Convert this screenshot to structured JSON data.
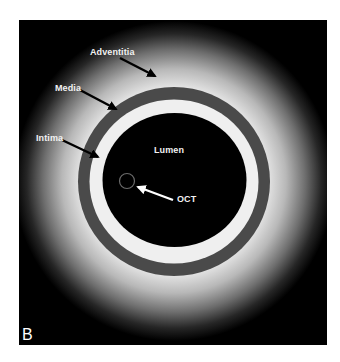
{
  "figure": {
    "panel_label": "B",
    "labels": {
      "adventitia": "Adventitia",
      "media": "Media",
      "intima": "Intima",
      "lumen": "Lumen",
      "oct": "OCT"
    },
    "colors": {
      "background": "#000000",
      "adventitia_glow": "#e8e8e8",
      "media_ring": "#4a4a4a",
      "intima_ring": "#f0f0f0",
      "lumen": "#000000",
      "catheter_outline": "#6a6a6a",
      "label_text": "#f2f2f2",
      "pointer_arrows": "#000000",
      "oct_arrow": "#ffffff"
    },
    "layers": [
      {
        "name": "Adventitia",
        "description": "diffuse bright halo fading outward"
      },
      {
        "name": "Media",
        "description": "dark grey ring"
      },
      {
        "name": "Intima",
        "description": "white ring"
      },
      {
        "name": "Lumen",
        "description": "black interior"
      },
      {
        "name": "OCT",
        "description": "small catheter circle inside lumen"
      }
    ]
  }
}
